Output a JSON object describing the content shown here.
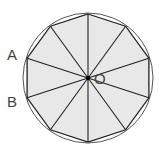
{
  "diagram": {
    "type": "regular decagon inscribed in circle",
    "sides": 10,
    "center": {
      "x": 88,
      "y": 78
    },
    "radius": 64,
    "circle_radius": 65,
    "labels": {
      "center": "O",
      "vertex_a": "A",
      "vertex_b": "B"
    },
    "colors": {
      "fill": "#e8e8e8",
      "stroke": "#222222",
      "circle": "#555555",
      "text": "#444444"
    }
  }
}
